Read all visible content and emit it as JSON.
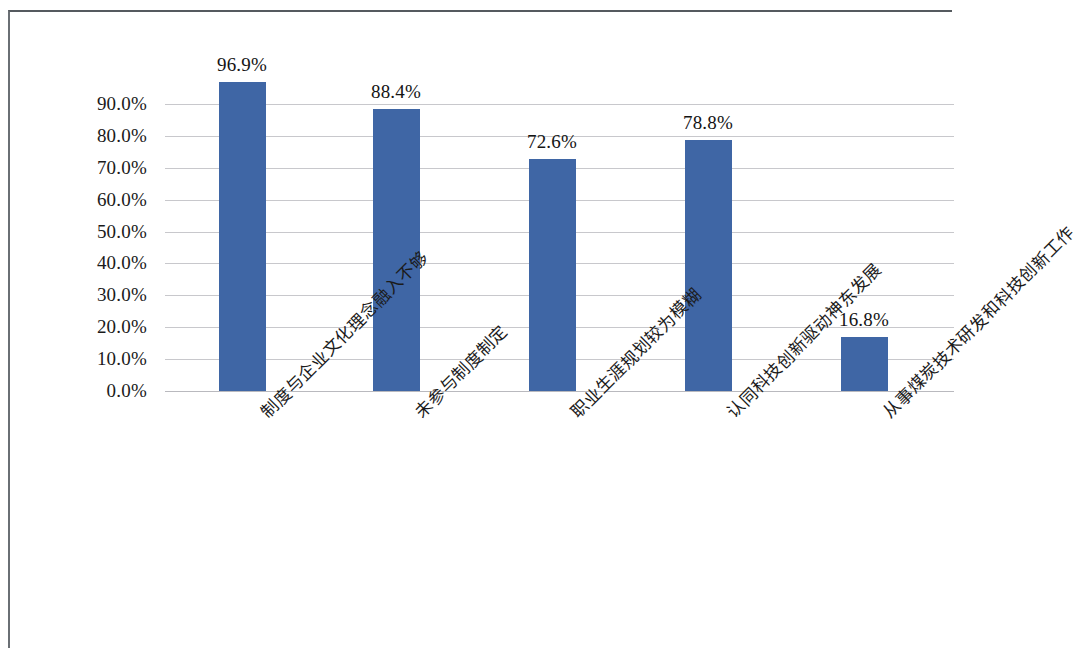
{
  "chart_data": {
    "type": "bar",
    "title": "",
    "subtitle": "",
    "xlabel": "",
    "ylabel": "",
    "categories": [
      "制度与企业文化理念融入不够",
      "未参与制度制定",
      "职业生涯规划较为模糊",
      "认同科技创新驱动神东发展",
      "从事煤炭技术研发和科技创新工作"
    ],
    "values": [
      96.9,
      88.4,
      72.6,
      78.8,
      16.8
    ],
    "data_labels": [
      "96.9%",
      "88.4%",
      "72.6%",
      "78.8%",
      "16.8%"
    ],
    "ylim": [
      0,
      100
    ],
    "ytick_values": [
      0,
      10,
      20,
      30,
      40,
      50,
      60,
      70,
      80,
      90
    ],
    "ytick_labels": [
      "0.0%",
      "10.0%",
      "20.0%",
      "30.0%",
      "40.0%",
      "50.0%",
      "60.0%",
      "70.0%",
      "80.0%",
      "90.0%"
    ],
    "series": [
      {
        "name": "",
        "values": [
          96.9,
          88.4,
          72.6,
          78.8,
          16.8
        ]
      }
    ],
    "grid": true,
    "grid_axis": "y",
    "legend": false,
    "legend_position": "none",
    "bar_color": "#3f66a5",
    "gridline_color": "#c8c8cc",
    "text_color": "#1a1a1a",
    "background_color": "#ffffff",
    "annotations": []
  }
}
